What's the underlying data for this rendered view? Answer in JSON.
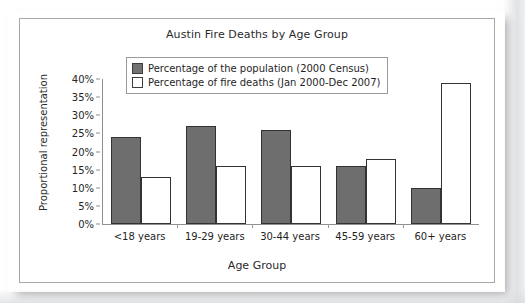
{
  "chart_data": {
    "type": "bar",
    "title": "Austin Fire Deaths by Age Group",
    "xlabel": "Age Group",
    "ylabel": "Proportional representation",
    "categories": [
      "<18 years",
      "19-29 years",
      "30-44 years",
      "45-59 years",
      "60+ years"
    ],
    "series": [
      {
        "name": "Percentage of the population (2000 Census)",
        "color": "#6e6e6e",
        "values": [
          24,
          27,
          26,
          16,
          10
        ]
      },
      {
        "name": "Percentage of fire deaths (Jan 2000-Dec 2007)",
        "color": "#ffffff",
        "values": [
          13,
          16,
          16,
          18,
          39
        ]
      }
    ],
    "ylim": [
      0,
      40
    ],
    "yticks": [
      0,
      5,
      10,
      15,
      20,
      25,
      30,
      35,
      40
    ],
    "ytick_labels": [
      "0%",
      "5%",
      "10%",
      "15%",
      "20%",
      "25%",
      "30%",
      "35%",
      "40%"
    ],
    "grid": false,
    "legend_position": "top-center-inside"
  },
  "legend": {
    "items": [
      {
        "label": "Percentage of the population (2000 Census)",
        "swatch": "filled-gray-swatch"
      },
      {
        "label": "Percentage of fire deaths (Jan 2000-Dec 2007)",
        "swatch": "outlined-white-swatch"
      }
    ]
  }
}
